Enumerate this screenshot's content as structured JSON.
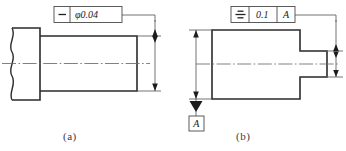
{
  "figure": {
    "background_color": "#ffffff",
    "line_color": "#2b2b2b",
    "thin_line_color": "#5a5a5a",
    "text_color": "#202020"
  },
  "parts": [
    {
      "id": "a",
      "caption": "(a)",
      "description": "shaft with straightness tolerance on axis",
      "feature_control_frame": {
        "symbol_name": "straightness-symbol",
        "symbol_glyph": "—",
        "tolerance_value": "φ0.04",
        "datum_reference": ""
      }
    },
    {
      "id": "b",
      "caption": "(b)",
      "description": "block with slot, symmetry tolerance to datum A",
      "feature_control_frame": {
        "symbol_name": "symmetry-symbol",
        "symbol_glyph": "≡",
        "tolerance_value": "0.1",
        "datum_reference": "A"
      },
      "datum_feature": {
        "label": "A"
      }
    }
  ]
}
